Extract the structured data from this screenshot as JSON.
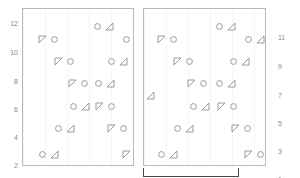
{
  "figure": {
    "type": "nested-pattern-diagram",
    "background": "#ffffff",
    "stroke_color": "#9a9a9a",
    "panel_border_color": "#b9b9b9",
    "bracket_color": "#4a4a4a",
    "axis_text_color": "#8a8a8a"
  },
  "axes": {
    "left": {
      "ticks": [
        "12",
        "10",
        "8",
        "6",
        "4",
        "2"
      ],
      "positions_px": [
        24,
        53,
        82,
        110,
        138,
        166
      ]
    },
    "right": {
      "ticks": [
        "11",
        "9",
        "7",
        "5",
        "3",
        "1"
      ],
      "positions_px": [
        38,
        67,
        96,
        124,
        152,
        180
      ]
    }
  },
  "panels": [
    {
      "name": "left-panel",
      "x": 22,
      "y": 8,
      "w": 112,
      "h": 158,
      "pairs": [
        {
          "row": 1,
          "x": 69,
          "y": 12,
          "order": "circle-triangle"
        },
        {
          "row": 2,
          "x": 14,
          "y": 25,
          "order": "triangle-circle"
        },
        {
          "row": 2,
          "x": 98,
          "y": 25,
          "order": "circle-triangle"
        },
        {
          "row": 3,
          "x": 30,
          "y": 47,
          "order": "triangle-circle"
        },
        {
          "row": 3,
          "x": 83,
          "y": 47,
          "order": "circle-triangle"
        },
        {
          "row": 4,
          "x": 44,
          "y": 69,
          "order": "triangle-circle"
        },
        {
          "row": 4,
          "x": 70,
          "y": 69,
          "order": "circle-triangle"
        },
        {
          "row": 5,
          "x": 45,
          "y": 92,
          "order": "circle-triangle"
        },
        {
          "row": 5,
          "x": 71,
          "y": 92,
          "order": "triangle-circle"
        },
        {
          "row": 6,
          "x": 30,
          "y": 114,
          "order": "circle-triangle"
        },
        {
          "row": 6,
          "x": 83,
          "y": 114,
          "order": "triangle-circle"
        },
        {
          "row": 7,
          "x": 14,
          "y": 140,
          "order": "circle-triangle"
        },
        {
          "row": 7,
          "x": 98,
          "y": 140,
          "order": "triangle-circle"
        }
      ]
    },
    {
      "name": "right-panel",
      "x": 143,
      "y": 8,
      "w": 123,
      "h": 158,
      "pairs": [
        {
          "row": 1,
          "x": 70,
          "y": 12,
          "order": "circle-triangle"
        },
        {
          "row": 2,
          "x": 12,
          "y": 25,
          "order": "triangle-circle"
        },
        {
          "row": 2,
          "x": 99,
          "y": 25,
          "order": "circle-triangle"
        },
        {
          "row": 3,
          "x": 28,
          "y": 47,
          "order": "triangle-circle"
        },
        {
          "row": 3,
          "x": 84,
          "y": 47,
          "order": "circle-triangle"
        },
        {
          "row": 4,
          "x": 42,
          "y": 69,
          "order": "triangle-circle"
        },
        {
          "row": 4,
          "x": 70,
          "y": 69,
          "order": "circle-triangle"
        },
        {
          "row": 4,
          "x": -11,
          "y": 81,
          "order": "circle-triangle"
        },
        {
          "row": 5,
          "x": 44,
          "y": 92,
          "order": "circle-triangle"
        },
        {
          "row": 5,
          "x": 72,
          "y": 92,
          "order": "triangle-circle"
        },
        {
          "row": 6,
          "x": 28,
          "y": 114,
          "order": "circle-triangle"
        },
        {
          "row": 6,
          "x": 86,
          "y": 114,
          "order": "triangle-circle"
        },
        {
          "row": 7,
          "x": 12,
          "y": 140,
          "order": "circle-triangle"
        },
        {
          "row": 7,
          "x": 99,
          "y": 140,
          "order": "triangle-circle"
        }
      ]
    }
  ],
  "bracket": {
    "x": 143,
    "y": 168,
    "w": 96,
    "h": 9
  }
}
